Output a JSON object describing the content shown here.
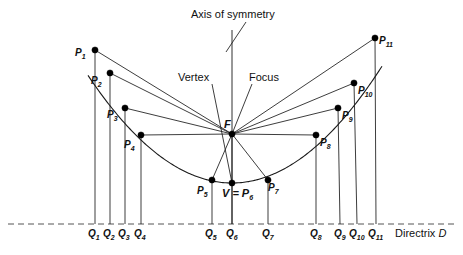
{
  "figure": {
    "title_annotations": {
      "axis_of_symmetry": "Axis of symmetry",
      "vertex": "Vertex",
      "focus": "Focus",
      "directrix": "Directrix D"
    },
    "focus_label": "F",
    "vertex_label": "V = P",
    "vertex_label_sub": "6",
    "colors": {
      "stroke": "#1a1a1a",
      "point_fill": "#000000",
      "directrix": "#555555",
      "background": "#ffffff"
    }
  },
  "geometry": {
    "focus": {
      "x": 232,
      "y": 134,
      "label": "F"
    },
    "vertex": {
      "x": 232,
      "y": 183
    },
    "directrix_y": 224,
    "directrix_x_start": 8,
    "directrix_x_end": 455,
    "axis_x": 232,
    "axis_top_y": 30,
    "axis_bottom_y": 224
  },
  "points": [
    {
      "id": "P1",
      "label": "P",
      "sub": "1",
      "x": 95,
      "y": 50,
      "lx": 75,
      "ly": 48,
      "qx": 95,
      "qlx": 88,
      "qsub": "1"
    },
    {
      "id": "P2",
      "label": "P",
      "sub": "2",
      "x": 110,
      "y": 73,
      "lx": 91,
      "ly": 76,
      "qx": 110,
      "qlx": 103,
      "qsub": "2"
    },
    {
      "id": "P3",
      "label": "P",
      "sub": "3",
      "x": 125,
      "y": 108,
      "lx": 107,
      "ly": 110,
      "qx": 125,
      "qlx": 118,
      "qsub": "3"
    },
    {
      "id": "P4",
      "label": "P",
      "sub": "4",
      "x": 141,
      "y": 135,
      "lx": 124,
      "ly": 140,
      "qx": 141,
      "qlx": 134,
      "qsub": "4"
    },
    {
      "id": "P5",
      "label": "P",
      "sub": "5",
      "x": 212,
      "y": 180,
      "lx": 197,
      "ly": 186,
      "qx": 212,
      "qlx": 205,
      "qsub": "5"
    },
    {
      "id": "P6",
      "label": "P",
      "sub": "6",
      "x": 232,
      "y": 183,
      "lx": 232,
      "ly": 190,
      "qx": 232,
      "qlx": 226,
      "qsub": "6"
    },
    {
      "id": "P7",
      "label": "P",
      "sub": "7",
      "x": 268,
      "y": 180,
      "lx": 268,
      "ly": 183,
      "qx": 268,
      "qlx": 262,
      "qsub": "7"
    },
    {
      "id": "P8",
      "label": "P",
      "sub": "8",
      "x": 316,
      "y": 135,
      "lx": 320,
      "ly": 138,
      "qx": 316,
      "qlx": 310,
      "qsub": "8"
    },
    {
      "id": "P9",
      "label": "P",
      "sub": "9",
      "x": 338,
      "y": 108,
      "lx": 342,
      "ly": 111,
      "qx": 340,
      "qlx": 334,
      "qsub": "9"
    },
    {
      "id": "P10",
      "label": "P",
      "sub": "10",
      "x": 354,
      "y": 83,
      "lx": 358,
      "ly": 86,
      "qx": 357,
      "qlx": 349,
      "qsub": "10"
    },
    {
      "id": "P11",
      "label": "P",
      "sub": "11",
      "x": 375,
      "y": 38,
      "lx": 379,
      "ly": 36,
      "qx": 376,
      "qlx": 368,
      "qsub": "11"
    }
  ],
  "annotations": {
    "axis_of_symmetry": {
      "text": "Axis of symmetry",
      "x": 191,
      "y": 9,
      "leader": {
        "x1": 246,
        "y1": 22,
        "x2": 226,
        "y2": 52
      }
    },
    "vertex": {
      "text": "Vertex",
      "x": 178,
      "y": 72,
      "leader": {
        "x1": 212,
        "y1": 84,
        "x2": 232,
        "y2": 183
      }
    },
    "focus": {
      "text": "Focus",
      "x": 249,
      "y": 72,
      "leader": {
        "x1": 252,
        "y1": 84,
        "x2": 232,
        "y2": 134
      }
    },
    "directrix": {
      "text": "Directrix D",
      "x": 395,
      "y": 228
    }
  },
  "parabola": {
    "a": 0.00519,
    "x_left": 88,
    "x_right": 382,
    "description": "Parabola with vertex V=P6, focus F, and directrix D"
  }
}
